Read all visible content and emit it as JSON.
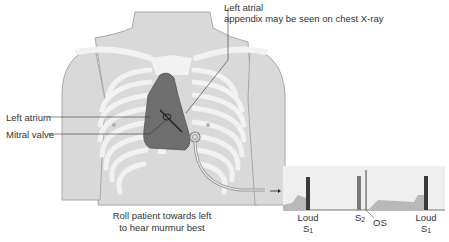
{
  "labels": {
    "left_atrial_appendix_line1": "Left atrial",
    "left_atrial_appendix_line2": "appendix may be seen on chest X-ray",
    "left_atrium": "Left atrium",
    "mitral_valve": "Mitral valve",
    "roll_patient_line1": "Roll patient towards left",
    "roll_patient_line2": "to hear murmur best"
  },
  "phonocardiogram": {
    "s1_first_loud": "Loud",
    "s1_first_sym": "S",
    "s1_first_sub": "1",
    "s2_sym": "S",
    "s2_sub": "2",
    "os": "OS",
    "s1_second_loud": "Loud",
    "s1_second_sym": "S",
    "s1_second_sub": "1"
  },
  "colors": {
    "skin": "#d9d9d9",
    "skin_outline": "#a8a8a8",
    "ribs": "#f2f2f2",
    "heart": "#6e6e6e",
    "bar_dark": "#3a3a3a",
    "bar_mid": "#7a7a7a",
    "murmur_fill": "#b9b9b9",
    "panel_bg": "#efefef"
  }
}
